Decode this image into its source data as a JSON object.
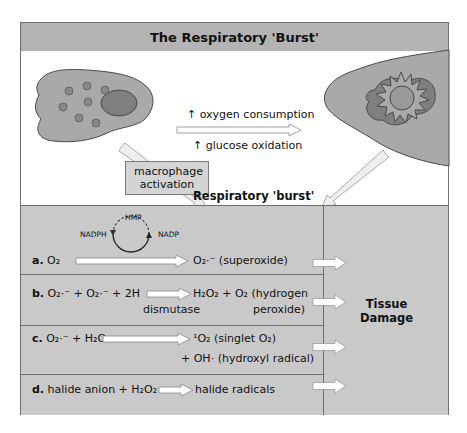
{
  "title": "The Respiratory 'Burst'",
  "top": {
    "arrow_label_top": "↑ oxygen consumption",
    "arrow_label_bottom": "↑ glucose oxidation",
    "activation_box": [
      "macrophage",
      "activation"
    ],
    "burst_label": "Respiratory 'burst'"
  },
  "cycle": {
    "left": "NADPH",
    "top": "HMP",
    "right": "NADP"
  },
  "reactions": [
    {
      "letter": "a.",
      "reactants": "O₂",
      "products": "O₂·⁻  (superoxide)"
    },
    {
      "letter": "b.",
      "reactants": "O₂·⁻ + O₂·⁻ + 2H",
      "enzyme": "dismutase",
      "products": "H₂O₂ + O₂ (hydrogen",
      "products_line2": "peroxide)"
    },
    {
      "letter": "c.",
      "reactants": "O₂·⁻ + H₂O₂",
      "products": "¹O₂ (singlet O₂)",
      "products_line2": "+ OH· (hydroxyl radical)"
    },
    {
      "letter": "d.",
      "reactants": "halide anion + H₂O₂",
      "products": "halide radicals"
    }
  ],
  "outcome": [
    "Tissue",
    "Damage"
  ],
  "colors": {
    "title_bg": "#b3b3b3",
    "panel_bg": "#c9c9c9",
    "cell_fill": "#a9a9a9",
    "nucleus_fill": "#7f7f7f",
    "border": "#6f6f6f"
  }
}
